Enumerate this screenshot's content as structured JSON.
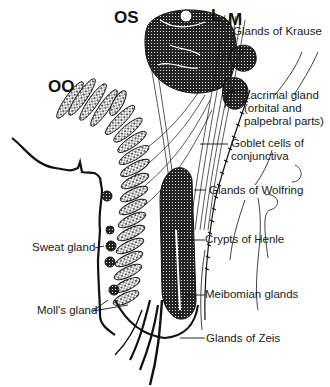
{
  "figure": {
    "muscle_labels": {
      "os": "OS",
      "oo": "OO",
      "l": "L",
      "m": "M"
    },
    "labels": {
      "glands_of_krause": "Glands of Krause",
      "lacrimal_line1": "Lacrimal gland",
      "lacrimal_line2": "(orbital and",
      "lacrimal_line3": "palpebral parts)",
      "goblet_line1": "Goblet cells of",
      "goblet_line2": "conjunctiva",
      "glands_of_wolfring": "Glands of Wolfring",
      "crypts_of_henle": "Crypts of Henle",
      "meibomian_glands": "Meibomian glands",
      "glands_of_zeis": "Glands of Zeis",
      "sweat_gland": "Sweat gland",
      "molls_gland": "Moll's gland"
    },
    "colors": {
      "ink": "#111111",
      "background": "#ffffff"
    }
  }
}
